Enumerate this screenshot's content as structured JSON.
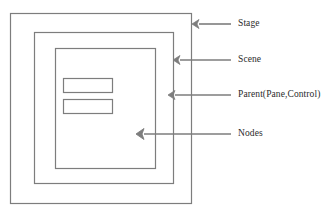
{
  "diagram": {
    "type": "nested-container-hierarchy",
    "stroke_color": "#7d7d7d",
    "text_color": "#2b2b2b",
    "background_color": "#ffffff",
    "boxes": [
      {
        "id": "stage",
        "label": "Stage",
        "level": 1,
        "x": 10,
        "y": 13,
        "width": 181,
        "height": 190
      },
      {
        "id": "scene",
        "label": "Scene",
        "level": 2,
        "x": 34,
        "y": 32,
        "width": 139,
        "height": 151
      },
      {
        "id": "parent",
        "label": "Parent(Pane,Control)",
        "level": 3,
        "x": 55,
        "y": 48,
        "width": 100,
        "height": 120
      },
      {
        "id": "node-1",
        "label": "Node",
        "level": 4,
        "x": 63,
        "y": 78,
        "width": 49,
        "height": 14
      },
      {
        "id": "node-2",
        "label": "Node",
        "level": 4,
        "x": 63,
        "y": 99,
        "width": 49,
        "height": 14
      }
    ],
    "callouts": [
      {
        "id": "callout-stage",
        "label": "Stage",
        "target": "stage",
        "arrow_tip_x": 193,
        "arrow_tip_y": 24,
        "line_end_x": 231,
        "label_x": 238,
        "label_y": 19
      },
      {
        "id": "callout-scene",
        "label": "Scene",
        "target": "scene",
        "arrow_tip_x": 174,
        "arrow_tip_y": 60,
        "line_end_x": 231,
        "label_x": 238,
        "label_y": 55
      },
      {
        "id": "callout-parent",
        "label": "Parent(Pane,Control)",
        "target": "parent",
        "arrow_tip_x": 169,
        "arrow_tip_y": 95,
        "line_end_x": 231,
        "label_x": 238,
        "label_y": 90
      },
      {
        "id": "callout-nodes",
        "label": "Nodes",
        "target": "node-2",
        "arrow_tip_x": 137,
        "arrow_tip_y": 134,
        "line_end_x": 231,
        "label_x": 238,
        "label_y": 129
      }
    ]
  }
}
